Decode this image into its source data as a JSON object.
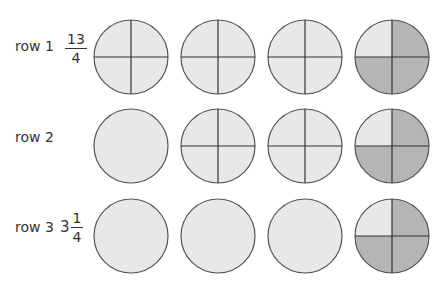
{
  "rows": [
    {
      "label": "row 1",
      "number": {
        "whole": "",
        "numerator": "13",
        "denominator": "4"
      },
      "circles": [
        {
          "divided": true,
          "shaded": [
            false,
            false,
            false,
            false
          ]
        },
        {
          "divided": true,
          "shaded": [
            false,
            false,
            false,
            false
          ]
        },
        {
          "divided": true,
          "shaded": [
            false,
            false,
            false,
            false
          ]
        },
        {
          "divided": true,
          "shaded": [
            false,
            true,
            true,
            true
          ]
        }
      ]
    },
    {
      "label": "row 2",
      "number": {
        "whole": "",
        "numerator": "",
        "denominator": ""
      },
      "circles": [
        {
          "divided": false,
          "shaded": [
            false,
            false,
            false,
            false
          ]
        },
        {
          "divided": true,
          "shaded": [
            false,
            false,
            false,
            false
          ]
        },
        {
          "divided": true,
          "shaded": [
            false,
            false,
            false,
            false
          ]
        },
        {
          "divided": true,
          "shaded": [
            false,
            true,
            true,
            true
          ]
        }
      ]
    },
    {
      "label": "row 3",
      "number": {
        "whole": "3",
        "numerator": "1",
        "denominator": "4"
      },
      "circles": [
        {
          "divided": false,
          "shaded": [
            false,
            false,
            false,
            false
          ]
        },
        {
          "divided": false,
          "shaded": [
            false,
            false,
            false,
            false
          ]
        },
        {
          "divided": false,
          "shaded": [
            false,
            false,
            false,
            false
          ]
        },
        {
          "divided": true,
          "shaded": [
            false,
            true,
            true,
            true
          ]
        }
      ]
    }
  ],
  "colors": {
    "light_fill": "#e8e8e8",
    "dark_fill": "#b5b5b5",
    "stroke": "#555555"
  }
}
